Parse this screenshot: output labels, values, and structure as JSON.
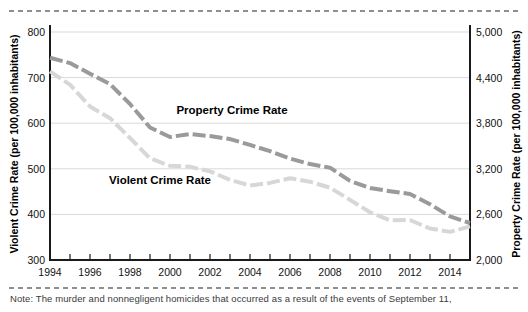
{
  "note": "Note: The murder and nonnegligent homicides that occurred as a result of the events of September 11,",
  "left_axis": {
    "title": "Violent Crime Rate (per 100,000 inhabitants)",
    "tick_labels": [
      "800",
      "700",
      "600",
      "500",
      "400",
      "300"
    ]
  },
  "right_axis": {
    "title": "Property Crime Rate (per 100,000 inhabitants)",
    "tick_labels": [
      "5,000",
      "4,400",
      "3,800",
      "3,200",
      "2,600",
      "2,000"
    ]
  },
  "x_axis": {
    "tick_labels": [
      "1994",
      "1996",
      "1998",
      "2000",
      "2002",
      "2004",
      "2006",
      "2008",
      "2010",
      "2012",
      "2014"
    ]
  },
  "series_labels": {
    "property": "Property Crime Rate",
    "violent": "Violent Crime Rate"
  },
  "colors": {
    "property_line": "#9a9a9a",
    "violent_line": "#d7d7d7",
    "gridline": "#d9d9d9",
    "axis": "#1a1a1a",
    "separator": "#8f8f8f",
    "label_text": "#000000",
    "note_text": "#3a3a3a"
  },
  "chart_data": {
    "type": "line",
    "x": [
      1994,
      1995,
      1996,
      1997,
      1998,
      1999,
      2000,
      2001,
      2002,
      2003,
      2004,
      2005,
      2006,
      2007,
      2008,
      2009,
      2010,
      2011,
      2012,
      2013,
      2014,
      2015
    ],
    "series": [
      {
        "name": "Violent Crime Rate",
        "axis": "left",
        "values": [
          713.6,
          684.5,
          636.6,
          611.0,
          567.6,
          523.0,
          506.5,
          504.5,
          494.4,
          475.8,
          463.2,
          469.0,
          479.3,
          471.8,
          458.6,
          431.9,
          404.5,
          387.1,
          387.8,
          369.1,
          361.6,
          373.7
        ]
      },
      {
        "name": "Property Crime Rate",
        "axis": "right",
        "values": [
          4660.2,
          4590.5,
          4451.0,
          4316.3,
          4052.5,
          3743.6,
          3618.3,
          3658.1,
          3630.6,
          3591.2,
          3514.1,
          3431.5,
          3334.5,
          3263.5,
          3214.6,
          3041.3,
          2945.9,
          2905.4,
          2868.0,
          2733.6,
          2574.1,
          2487.0
        ]
      }
    ],
    "left_ylim": [
      300,
      800
    ],
    "right_ylim": [
      2000,
      5000
    ],
    "left_yticks": [
      800,
      700,
      600,
      500,
      400,
      300
    ],
    "right_yticks": [
      5000,
      4400,
      3800,
      3200,
      2600,
      2000
    ],
    "xticks": [
      1994,
      1996,
      1998,
      2000,
      2002,
      2004,
      2006,
      2008,
      2010,
      2012,
      2014
    ],
    "xlabel": "",
    "ylabel_left": "Violent Crime Rate (per 100,000 inhabitants)",
    "ylabel_right": "Property Crime Rate (per 100,000 inhabitants)",
    "grid": true,
    "legend": "inline-labels"
  }
}
